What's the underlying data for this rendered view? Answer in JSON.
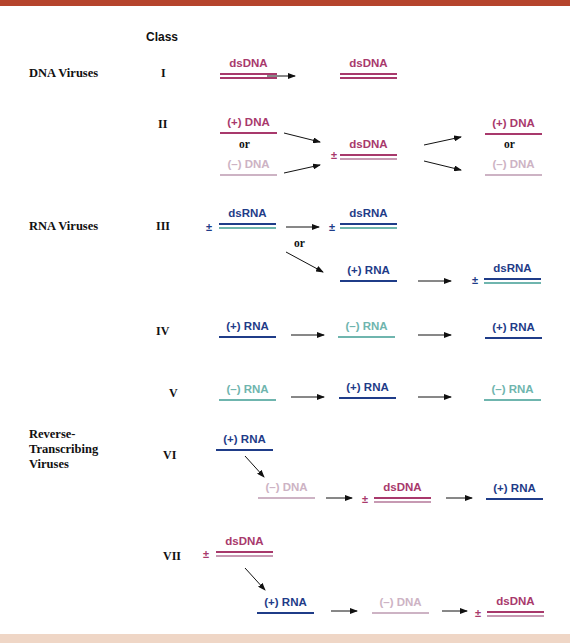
{
  "colors": {
    "ds_dna": "#a8396c",
    "ds_dna_second": "#c79ab3",
    "plus_dna": "#a8396c",
    "minus_dna": "#cdb3c4",
    "plus_rna": "#1f3c88",
    "minus_rna": "#6fb5ae",
    "top_bar": "#b5442c",
    "bottom_bar": "#efd6c6"
  },
  "header": {
    "class_label": "Class"
  },
  "groups": [
    {
      "label": "DNA Viruses"
    },
    {
      "label": "RNA Viruses"
    },
    {
      "label": "Reverse-Transcribing Viruses"
    }
  ],
  "classes": [
    {
      "roman": "I"
    },
    {
      "roman": "II"
    },
    {
      "roman": "III"
    },
    {
      "roman": "IV"
    },
    {
      "roman": "V"
    },
    {
      "roman": "VI"
    },
    {
      "roman": "VII"
    }
  ],
  "or_label": "or",
  "plus_minus": "±",
  "molecules": {
    "c1_a": "dsDNA",
    "c1_b": "dsDNA",
    "c2_a": "(+) DNA",
    "c2_b": "(–) DNA",
    "c2_c": "dsDNA",
    "c2_d": "(+) DNA",
    "c2_e": "(–) DNA",
    "c3_a": "dsRNA",
    "c3_b": "dsRNA",
    "c3_c": "(+) RNA",
    "c3_d": "dsRNA",
    "c4_a": "(+) RNA",
    "c4_b": "(–) RNA",
    "c4_c": "(+) RNA",
    "c5_a": "(–) RNA",
    "c5_b": "(+) RNA",
    "c5_c": "(–) RNA",
    "c6_a": "(+) RNA",
    "c6_b": "(–) DNA",
    "c6_c": "dsDNA",
    "c6_d": "(+) RNA",
    "c7_a": "dsDNA",
    "c7_b": "(+) RNA",
    "c7_c": "(–) DNA",
    "c7_d": "dsDNA"
  }
}
